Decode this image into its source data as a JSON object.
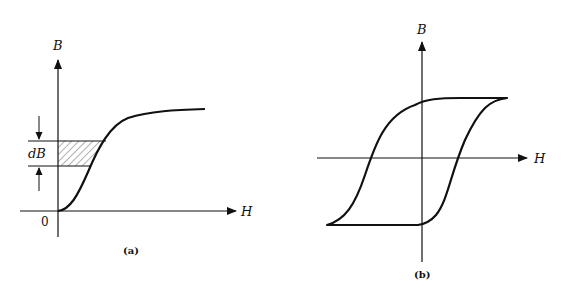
{
  "figure_a": {
    "y_axis_label": "B",
    "x_axis_label": "H",
    "origin_label": "0",
    "increment_label": "dB",
    "caption": "(a)",
    "curve": "initial magnetization (B-H) curve, S-shaped rising to saturation",
    "shaded_region": "hatched band between the B axis and the curve, height dB"
  },
  "figure_b": {
    "y_axis_label": "B",
    "x_axis_label": "H",
    "caption": "(b)",
    "curve": "hysteresis loop (B-H loop)"
  },
  "colors": {
    "stroke": "#111111",
    "background": "#ffffff"
  }
}
